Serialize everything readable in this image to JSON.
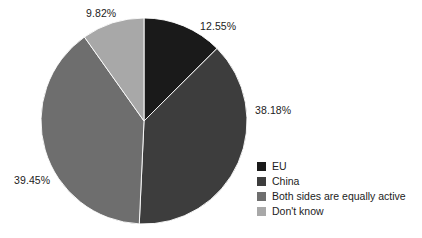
{
  "chart_data": {
    "type": "pie",
    "title": "",
    "subtitle": "",
    "xlabel": "",
    "ylabel": "",
    "grid": false,
    "legend_position": "right-bottom",
    "units": "percent",
    "start_angle_deg": 0,
    "direction": "clockwise",
    "categories": [
      "EU",
      "China",
      "Both sides are equally active",
      "Don't know"
    ],
    "values": [
      12.55,
      38.18,
      39.45,
      9.82
    ],
    "labels": [
      "12.55%",
      "38.18%",
      "39.45%",
      "9.82%"
    ],
    "colors": [
      "#1a1a1a",
      "#3d3d3d",
      "#6e6e6e",
      "#a8a8a8"
    ],
    "slices": [
      {
        "name": "EU",
        "value": 12.55,
        "label": "12.55%",
        "color": "#1a1a1a",
        "start_angle_deg": 0.0,
        "end_angle_deg": 45.18
      },
      {
        "name": "China",
        "value": 38.18,
        "label": "38.18%",
        "color": "#3d3d3d",
        "start_angle_deg": 45.18,
        "end_angle_deg": 182.63
      },
      {
        "name": "Both sides are equally active",
        "value": 39.45,
        "label": "39.45%",
        "color": "#6e6e6e",
        "start_angle_deg": 182.63,
        "end_angle_deg": 324.65
      },
      {
        "name": "Don't know",
        "value": 9.82,
        "label": "9.82%",
        "color": "#a8a8a8",
        "start_angle_deg": 324.65,
        "end_angle_deg": 360.0
      }
    ]
  },
  "labels": {
    "top_left": "9.82%",
    "top_right": "12.55%",
    "right": "38.18%",
    "left": "39.45%"
  },
  "legend": {
    "items": [
      {
        "label": "EU",
        "color": "#1a1a1a"
      },
      {
        "label": "China",
        "color": "#3d3d3d"
      },
      {
        "label": "Both sides are equally active",
        "color": "#6e6e6e"
      },
      {
        "label": "Don't know",
        "color": "#a8a8a8"
      }
    ]
  },
  "geometry": {
    "center_x": 144,
    "center_y": 121,
    "radius": 103
  },
  "colors": {
    "background": "#ffffff",
    "text": "#1c1c1c"
  }
}
